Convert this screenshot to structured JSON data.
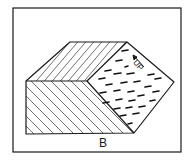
{
  "figure": {
    "label": "B",
    "direction_label": "UP",
    "colors": {
      "stroke": "#1a1a1a",
      "background": "#ffffff"
    },
    "faces": [
      {
        "name": "top-face",
        "pattern": "diagonal-hatch"
      },
      {
        "name": "front-face",
        "pattern": "diagonal-hatch"
      },
      {
        "name": "side-face",
        "pattern": "short-dashes"
      }
    ]
  }
}
